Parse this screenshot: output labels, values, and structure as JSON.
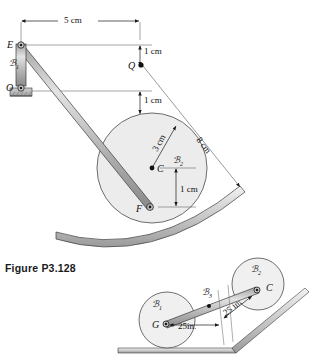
{
  "figure": {
    "caption": "Figure P3.128",
    "upper": {
      "points": {
        "E": "E",
        "O": "O",
        "Q": "Q",
        "C": "C",
        "F": "F"
      },
      "bodies": {
        "bar_OE": "ℬ",
        "bar_OE_sub": "1",
        "disk": "ℬ",
        "disk_sub": "2"
      },
      "dimensions": {
        "horizontal_EQ": "5 cm",
        "vertical_top": "1 cm",
        "vertical_bottom": "1 cm",
        "radius": "3 cm",
        "offset_CF": "1 cm",
        "cord_Q_to_surface": "8 cm"
      }
    },
    "lower": {
      "points": {
        "G": "G",
        "C": "C"
      },
      "bodies": {
        "disk_left": "ℬ",
        "disk_left_sub": "1",
        "disk_right": "ℬ",
        "disk_right_sub": "2",
        "bar": "ℬ",
        "bar_sub": "3"
      },
      "dimensions": {
        "horizontal_G": "25in.",
        "incline_C": "25 in."
      }
    },
    "colors": {
      "line": "#1a1a1a",
      "disk_fill": "#e9e9e9",
      "bar_fill": "#b8b8b8",
      "bar_highlight": "#dcdcdc",
      "surface_fill": "#c9c9c9",
      "thin_line": "#555555"
    }
  }
}
